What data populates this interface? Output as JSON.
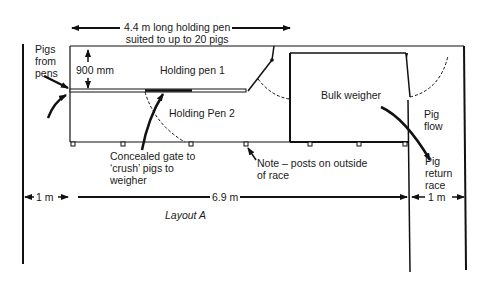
{
  "diagram": {
    "title": "Layout A",
    "top_dimension": {
      "line1": "4.4 m long holding pen",
      "line2": "suited to up to 20 pigs"
    },
    "labels": {
      "pigs_from_pens": [
        "Pigs",
        "from",
        "pens"
      ],
      "pen_width": "900 mm",
      "holding_pen_1": "Holding pen 1",
      "holding_pen_2": "Holding Pen 2",
      "bulk_weigher": "Bulk weigher",
      "pig_flow": [
        "Pig",
        "flow"
      ],
      "pig_return_race": [
        "Pig",
        "return",
        "race"
      ],
      "concealed_gate": [
        "Concealed gate to",
        "‘crush’ pigs to",
        "weigher"
      ],
      "note_posts": [
        "Note – posts on outside",
        "of race"
      ]
    },
    "dimensions": {
      "left_gap": "1 m",
      "main_length": "6.9 m",
      "right_gap": "1 m"
    }
  }
}
